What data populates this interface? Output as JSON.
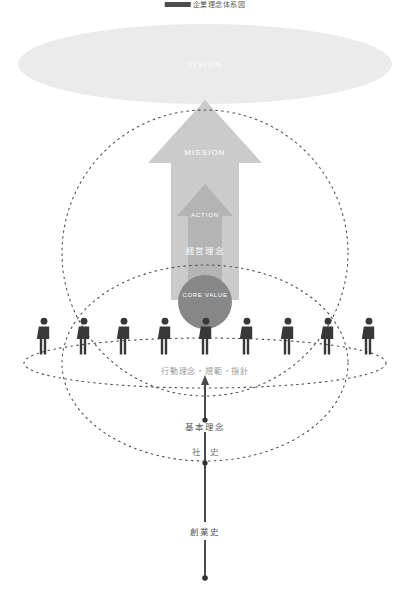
{
  "diagram": {
    "title": "企業理念体系図",
    "labels": {
      "vision": "VISION",
      "mission": "MISSION",
      "action": "ACTION",
      "core_value": "CORE VALUE",
      "keiei_rinen": "経営理念",
      "kodo_rinen": "行動理念・規範・指針",
      "kihon_rinen": "基本理念",
      "shashi": "社 史",
      "sogyoshi": "創業史"
    },
    "people_count": 9,
    "colors": {
      "vision_ellipse": "#ebebeb",
      "mission_arrow": "#cccccc",
      "action_arrow": "#b3b3b3",
      "core_circle": "#878787",
      "person": "#3a3a3a",
      "dashed_line": "#555555",
      "axis_line": "#4a4a4a",
      "gray_text": "#9a9a9a"
    }
  }
}
